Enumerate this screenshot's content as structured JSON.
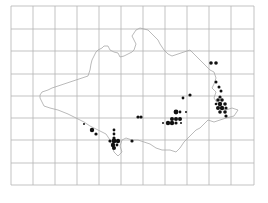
{
  "map": {
    "type": "distribution-map",
    "width": 268,
    "height": 203,
    "colors": {
      "background": "#ffffff",
      "grid": "#b4b4b4",
      "outline": "#a8a8a8",
      "dot": "#111111"
    },
    "grid": {
      "x_lines": [
        11,
        33,
        55,
        77,
        99,
        121,
        143,
        165,
        187,
        209,
        231,
        254
      ],
      "y_lines": [
        6,
        29,
        51,
        74,
        96,
        118,
        140,
        163,
        185
      ],
      "x_min": 11,
      "x_max": 254,
      "y_min": 6,
      "y_max": 185
    },
    "outline_path": "M40,95 L42,92 L48,90 L52,88 L58,86 L64,84 L70,82 L76,80 L82,78 L88,76 L90,70 L91,64 L92,60 L94,56 L96,52 L98,50 L102,48 L104,46 L108,46 L110,50 L114,52 L118,53 L120,57 L124,56 L128,54 L132,52 L134,50 L136,44 L134,40 L132,36 L136,30 L140,28 L148,30 L154,36 L158,40 L160,44 L164,50 L168,54 L172,56 L178,54 L184,52 L190,50 L194,54 L198,58 L202,62 L206,66 L210,70 L214,72 L216,78 L214,84 L212,88 L216,92 L214,98 L218,104 L220,108 L226,110 L232,108 L238,110 L234,116 L226,118 L220,120 L214,122 L208,120 L204,124 L200,128 L196,130 L192,134 L188,138 L184,142 L180,148 L176,152 L170,150 L162,150 L156,148 L150,144 L144,142 L138,140 L132,140 L126,138 L122,140 L120,146 L122,152 L118,156 L114,152 L112,146 L110,140 L106,134 L98,130 L90,126 L84,122 L76,118 L68,114 L58,110 L50,108 L44,106 L42,102 L40,98 Z",
    "dots": [
      {
        "x": 211,
        "y": 63,
        "r": 1.8
      },
      {
        "x": 216,
        "y": 63,
        "r": 1.8
      },
      {
        "x": 216,
        "y": 82,
        "r": 1.5
      },
      {
        "x": 219,
        "y": 87,
        "r": 1.5
      },
      {
        "x": 221,
        "y": 91,
        "r": 1.5
      },
      {
        "x": 220,
        "y": 97,
        "r": 1.6
      },
      {
        "x": 218,
        "y": 100,
        "r": 1.8
      },
      {
        "x": 222,
        "y": 100,
        "r": 1.8
      },
      {
        "x": 216,
        "y": 104,
        "r": 1.3
      },
      {
        "x": 220,
        "y": 104,
        "r": 2.2
      },
      {
        "x": 225,
        "y": 104,
        "r": 1.8
      },
      {
        "x": 218,
        "y": 108,
        "r": 2.0
      },
      {
        "x": 222,
        "y": 108,
        "r": 2.2
      },
      {
        "x": 226,
        "y": 108,
        "r": 1.6
      },
      {
        "x": 220,
        "y": 112,
        "r": 1.8
      },
      {
        "x": 225,
        "y": 112,
        "r": 1.8
      },
      {
        "x": 226,
        "y": 116,
        "r": 1.6
      },
      {
        "x": 183,
        "y": 98,
        "r": 1.4
      },
      {
        "x": 190,
        "y": 95,
        "r": 1.6
      },
      {
        "x": 176,
        "y": 112,
        "r": 2.4
      },
      {
        "x": 180,
        "y": 112,
        "r": 1.4
      },
      {
        "x": 186,
        "y": 112,
        "r": 1.0
      },
      {
        "x": 172,
        "y": 119,
        "r": 2.0
      },
      {
        "x": 176,
        "y": 119,
        "r": 2.0
      },
      {
        "x": 180,
        "y": 119,
        "r": 2.0
      },
      {
        "x": 168,
        "y": 123,
        "r": 2.2
      },
      {
        "x": 172,
        "y": 123,
        "r": 2.2
      },
      {
        "x": 176,
        "y": 123,
        "r": 1.6
      },
      {
        "x": 163,
        "y": 123,
        "r": 1.0
      },
      {
        "x": 181,
        "y": 123,
        "r": 1.0
      },
      {
        "x": 138,
        "y": 117,
        "r": 1.6
      },
      {
        "x": 141,
        "y": 117,
        "r": 1.6
      },
      {
        "x": 84,
        "y": 124,
        "r": 1.0
      },
      {
        "x": 92,
        "y": 130,
        "r": 2.2
      },
      {
        "x": 96,
        "y": 134,
        "r": 1.6
      },
      {
        "x": 114,
        "y": 130,
        "r": 1.4
      },
      {
        "x": 114,
        "y": 134,
        "r": 1.4
      },
      {
        "x": 114,
        "y": 138,
        "r": 1.6
      },
      {
        "x": 110,
        "y": 141,
        "r": 1.6
      },
      {
        "x": 114,
        "y": 141,
        "r": 2.4
      },
      {
        "x": 118,
        "y": 141,
        "r": 2.2
      },
      {
        "x": 113,
        "y": 145,
        "r": 2.2
      },
      {
        "x": 117,
        "y": 145,
        "r": 1.4
      },
      {
        "x": 114,
        "y": 148,
        "r": 2.0
      },
      {
        "x": 132,
        "y": 141,
        "r": 1.6
      }
    ]
  }
}
